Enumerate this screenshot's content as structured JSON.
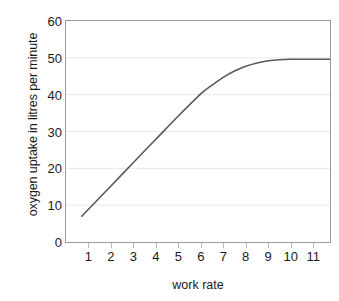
{
  "chart_data": {
    "type": "line",
    "title": "",
    "xlabel": "work rate",
    "ylabel": "oxygen uptake in litres per minute",
    "xlim": [
      0,
      11.75
    ],
    "ylim": [
      0,
      60
    ],
    "xticks": [
      "1",
      "2",
      "3",
      "4",
      "5",
      "6",
      "7",
      "8",
      "9",
      "10",
      "11"
    ],
    "yticks": [
      "0",
      "10",
      "20",
      "30",
      "40",
      "50",
      "60"
    ],
    "grid": "horizontal",
    "legend": "none",
    "series": [
      {
        "name": "oxygen uptake",
        "color": "#595959",
        "x": [
          0.7,
          1.0,
          2.0,
          3.0,
          4.0,
          5.0,
          6.0,
          6.5,
          7.0,
          7.5,
          8.0,
          8.5,
          9.0,
          9.5,
          10.0,
          10.5,
          11.0,
          11.75
        ],
        "y": [
          7.0,
          8.9,
          15.2,
          21.6,
          27.9,
          34.2,
          40.2,
          42.6,
          44.7,
          46.4,
          47.7,
          48.6,
          49.2,
          49.5,
          49.6,
          49.6,
          49.6,
          49.6
        ]
      }
    ]
  },
  "axes": {
    "frame_color": "#9a9a9a",
    "grid_color": "#e8e8e8",
    "tick_color": "#b8b8b8",
    "text_color": "#1a1a1a"
  }
}
